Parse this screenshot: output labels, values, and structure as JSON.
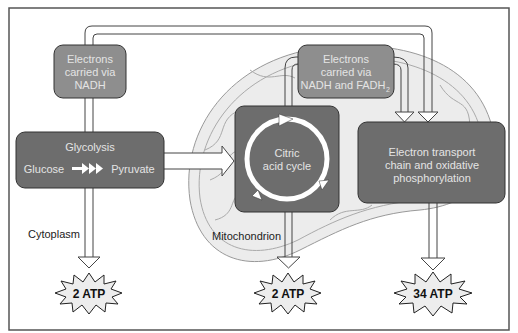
{
  "diagram": {
    "type": "cellular-respiration-flow",
    "colors": {
      "dark_box": "#6d6d6d",
      "medium_box": "#8e8e8e",
      "mitochondrion_fill": "#ececec",
      "frame_border": "#555555",
      "starburst_fill": "#ededed"
    },
    "nodes": {
      "electrons_nadh": {
        "line1": "Electrons",
        "line2": "carried via",
        "line3": "NADH"
      },
      "electrons_nadh_fadh": {
        "line1": "Electrons",
        "line2": "carried via",
        "line3": "NADH and FADH",
        "subscript": "2"
      },
      "glycolysis": {
        "title": "Glycolysis",
        "input": "Glucose",
        "output": "Pyruvate"
      },
      "citric_acid": {
        "line1": "Citric",
        "line2": "acid cycle"
      },
      "etc": {
        "line1": "Electron transport",
        "line2": "chain and oxidative",
        "line3": "phosphorylation"
      }
    },
    "labels": {
      "cytoplasm": "Cytoplasm",
      "mitochondrion": "Mitochondrion"
    },
    "outputs": [
      {
        "label": "2 ATP",
        "source": "glycolysis"
      },
      {
        "label": "2 ATP",
        "source": "citric_acid"
      },
      {
        "label": "34 ATP",
        "source": "etc"
      }
    ]
  }
}
